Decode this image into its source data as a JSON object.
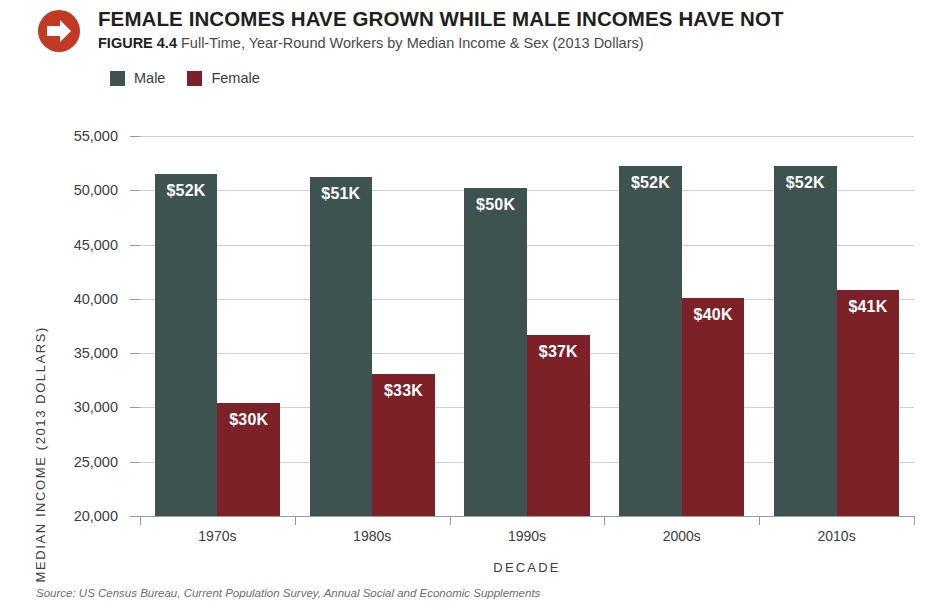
{
  "header": {
    "icon": "arrow-right-circle-icon",
    "icon_color": "#C33A24",
    "title": "FEMALE INCOMES HAVE GROWN WHILE MALE INCOMES HAVE NOT",
    "figure_label": "FIGURE 4.4",
    "subtitle": "Full-Time, Year-Round Workers by Median Income & Sex (2013 Dollars)"
  },
  "legend": {
    "position": "top-left",
    "items": [
      {
        "label": "Male",
        "color": "#3E5350"
      },
      {
        "label": "Female",
        "color": "#7C2128"
      }
    ]
  },
  "source": "Source: US Census Bureau, Current Population Survey, Annual Social and Economic Supplements",
  "chart_data": {
    "type": "bar",
    "title": "FEMALE INCOMES HAVE GROWN WHILE MALE INCOMES HAVE NOT",
    "subtitle": "Full-Time, Year-Round Workers by Median Income & Sex (2013 Dollars)",
    "xlabel": "DECADE",
    "ylabel": "MEDIAN INCOME (2013 DOLLARS)",
    "ylim": [
      20000,
      55000
    ],
    "ytick_values": [
      55000,
      50000,
      45000,
      40000,
      35000,
      30000,
      25000,
      20000
    ],
    "ytick_labels": [
      "55,000",
      "50,000",
      "45,000",
      "40,000",
      "35,000",
      "30,000",
      "25,000",
      "20,000"
    ],
    "grid": true,
    "legend_position": "top-left",
    "categories": [
      "1970s",
      "1980s",
      "1990s",
      "2000s",
      "2010s"
    ],
    "series": [
      {
        "name": "Male",
        "color": "#3E5350",
        "values": [
          51500,
          51200,
          50200,
          52200,
          52200
        ],
        "labels": [
          "$52K",
          "$51K",
          "$50K",
          "$52K",
          "$52K"
        ]
      },
      {
        "name": "Female",
        "color": "#7C2128",
        "values": [
          30400,
          33100,
          36700,
          40100,
          40800
        ],
        "labels": [
          "$30K",
          "$33K",
          "$37K",
          "$40K",
          "$41K"
        ]
      }
    ]
  }
}
